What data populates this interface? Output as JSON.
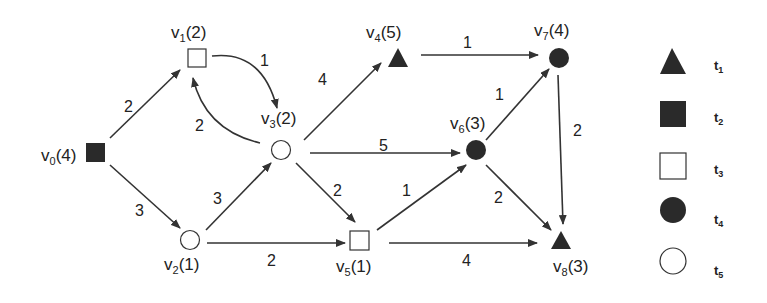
{
  "graph": {
    "nodes": [
      {
        "id": "v0",
        "name": "v",
        "sub": "0",
        "value": "(4)",
        "type": "t2",
        "shape": "square-filled"
      },
      {
        "id": "v1",
        "name": "v",
        "sub": "1",
        "value": "(2)",
        "type": "t3",
        "shape": "square-hollow"
      },
      {
        "id": "v2",
        "name": "v",
        "sub": "2",
        "value": "(1)",
        "type": "t5",
        "shape": "circle-hollow"
      },
      {
        "id": "v3",
        "name": "v",
        "sub": "3",
        "value": "(2)",
        "type": "t5",
        "shape": "circle-hollow"
      },
      {
        "id": "v4",
        "name": "v",
        "sub": "4",
        "value": "(5)",
        "type": "t1",
        "shape": "triangle-filled"
      },
      {
        "id": "v5",
        "name": "v",
        "sub": "5",
        "value": "(1)",
        "type": "t3",
        "shape": "square-hollow"
      },
      {
        "id": "v6",
        "name": "v",
        "sub": "6",
        "value": "(3)",
        "type": "t4",
        "shape": "circle-filled"
      },
      {
        "id": "v7",
        "name": "v",
        "sub": "7",
        "value": "(4)",
        "type": "t4",
        "shape": "circle-filled"
      },
      {
        "id": "v8",
        "name": "v",
        "sub": "8",
        "value": "(3)",
        "type": "t1",
        "shape": "triangle-filled"
      }
    ],
    "edges": [
      {
        "from": "v0",
        "to": "v1",
        "weight": "2"
      },
      {
        "from": "v0",
        "to": "v2",
        "weight": "3"
      },
      {
        "from": "v1",
        "to": "v3",
        "weight": "1"
      },
      {
        "from": "v3",
        "to": "v1",
        "weight": "2"
      },
      {
        "from": "v2",
        "to": "v3",
        "weight": "3"
      },
      {
        "from": "v2",
        "to": "v5",
        "weight": "2"
      },
      {
        "from": "v3",
        "to": "v4",
        "weight": "4"
      },
      {
        "from": "v3",
        "to": "v6",
        "weight": "5"
      },
      {
        "from": "v3",
        "to": "v5",
        "weight": "2"
      },
      {
        "from": "v4",
        "to": "v7",
        "weight": "1"
      },
      {
        "from": "v5",
        "to": "v6",
        "weight": "1"
      },
      {
        "from": "v5",
        "to": "v8",
        "weight": "4"
      },
      {
        "from": "v6",
        "to": "v7",
        "weight": "1"
      },
      {
        "from": "v6",
        "to": "v8",
        "weight": "2"
      },
      {
        "from": "v7",
        "to": "v8",
        "weight": "2"
      }
    ]
  },
  "legend": [
    {
      "name": "t",
      "sub": "1",
      "shape": "triangle-filled"
    },
    {
      "name": "t",
      "sub": "2",
      "shape": "square-filled"
    },
    {
      "name": "t",
      "sub": "3",
      "shape": "square-hollow"
    },
    {
      "name": "t",
      "sub": "4",
      "shape": "circle-filled"
    },
    {
      "name": "t",
      "sub": "5",
      "shape": "circle-hollow"
    }
  ],
  "colors": {
    "ink": "#222222",
    "fill": "#2a2a2a",
    "background": "#ffffff"
  }
}
